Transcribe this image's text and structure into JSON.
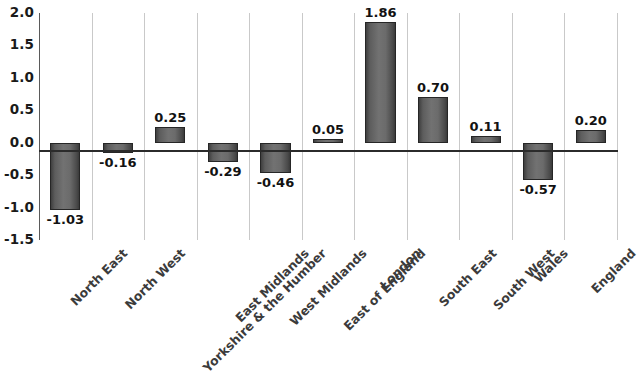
{
  "chart_data": {
    "type": "bar",
    "title": "",
    "subtitle": "",
    "xlabel": "",
    "ylabel": "",
    "ylim": [
      -1.5,
      2.0
    ],
    "yticks": [
      "2.0",
      "1.5",
      "1.0",
      "0.5",
      "0.0",
      "-0.5",
      "-1.0",
      "-1.5"
    ],
    "ytick_values": [
      2.0,
      1.5,
      1.0,
      0.5,
      0.0,
      -0.5,
      -1.0,
      -1.5
    ],
    "grid": "vertical-category-separators",
    "legend": "none",
    "categories": [
      "North East",
      "North West",
      "Yorkshire & the Humber",
      "East Midlands",
      "West Midlands",
      "East of England",
      "London",
      "South East",
      "South West",
      "Wales",
      "England"
    ],
    "values": [
      -1.03,
      -0.16,
      0.25,
      -0.29,
      -0.46,
      0.05,
      1.86,
      0.7,
      0.11,
      -0.57,
      0.2
    ],
    "data_labels": [
      "-1.03",
      "-0.16",
      "0.25",
      "-0.29",
      "-0.46",
      "0.05",
      "1.86",
      "0.70",
      "0.11",
      "-0.57",
      "0.20"
    ],
    "bar_color": "#6b6b6b",
    "bar_border_color": "#262626",
    "axis_color": "#5a5a5a",
    "gridline_color": "#c9c9c9",
    "label_color": "#3b3b3b",
    "value_label_color": "#121212"
  }
}
